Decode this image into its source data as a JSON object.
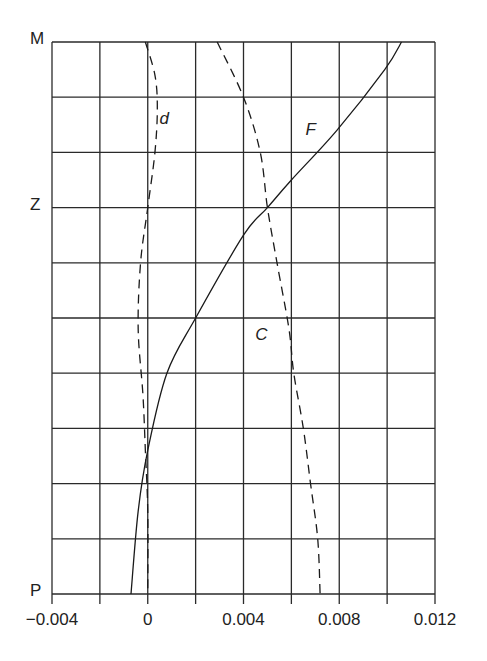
{
  "chart_data": {
    "type": "line",
    "title": "",
    "xlabel": "",
    "ylabel": "",
    "xlim": [
      -0.004,
      0.012
    ],
    "x_ticks": [
      -0.004,
      0,
      0.004,
      0.008,
      0.012
    ],
    "x_tick_labels": [
      "−0.004",
      "0",
      "0.004",
      "0.008",
      "0.012"
    ],
    "x_grid_step": 0.002,
    "y_axis": "position from M (top, 0) to P (bottom, 10), 10 grid divisions",
    "ylim": [
      0,
      10
    ],
    "y_labels": [
      {
        "label": "M",
        "pos": 0
      },
      {
        "label": "Z",
        "pos": 3
      },
      {
        "label": "P",
        "pos": 10
      }
    ],
    "grid": true,
    "legend": "inline curve labels",
    "series": [
      {
        "name": "F",
        "style": "solid",
        "label_pos": {
          "x": 0.0068,
          "y": 1.6
        },
        "points": [
          {
            "y": 0,
            "x": 0.0106
          },
          {
            "y": 0.5,
            "x": 0.0099
          },
          {
            "y": 1.6,
            "x": 0.0079
          },
          {
            "y": 2.5,
            "x": 0.006
          },
          {
            "y": 3,
            "x": 0.005
          },
          {
            "y": 3.5,
            "x": 0.004
          },
          {
            "y": 5,
            "x": 0.002
          },
          {
            "y": 6,
            "x": 0.0008
          },
          {
            "y": 7.4,
            "x": 0.0
          },
          {
            "y": 8.5,
            "x": -0.0004
          },
          {
            "y": 10,
            "x": -0.0007
          }
        ]
      },
      {
        "name": "C",
        "style": "dashed",
        "label_pos": {
          "x": 0.0047,
          "y": 5.3
        },
        "points": [
          {
            "y": 0,
            "x": 0.0029
          },
          {
            "y": 1,
            "x": 0.004
          },
          {
            "y": 2,
            "x": 0.0047
          },
          {
            "y": 3,
            "x": 0.005
          },
          {
            "y": 4,
            "x": 0.0054
          },
          {
            "y": 5.2,
            "x": 0.0059
          },
          {
            "y": 6,
            "x": 0.0061
          },
          {
            "y": 7,
            "x": 0.0065
          },
          {
            "y": 8,
            "x": 0.0068
          },
          {
            "y": 9,
            "x": 0.0071
          },
          {
            "y": 10,
            "x": 0.0072
          }
        ]
      },
      {
        "name": "d",
        "style": "dashed",
        "label_pos": {
          "x": 0.0007,
          "y": 1.4
        },
        "points": [
          {
            "y": 0,
            "x": -0.0001
          },
          {
            "y": 0.6,
            "x": 0.0003
          },
          {
            "y": 1.2,
            "x": 0.0004
          },
          {
            "y": 2,
            "x": 0.0003
          },
          {
            "y": 3,
            "x": 0.0
          },
          {
            "y": 4,
            "x": -0.0003
          },
          {
            "y": 5.2,
            "x": -0.0004
          },
          {
            "y": 6.4,
            "x": -0.0002
          },
          {
            "y": 7.4,
            "x": -0.0001
          },
          {
            "y": 8.5,
            "x": 0.0
          },
          {
            "y": 10,
            "x": 0.0
          }
        ]
      }
    ]
  },
  "colors": {
    "line": "#1a1a1a",
    "grid": "#2a2a2a",
    "background": "#ffffff"
  }
}
